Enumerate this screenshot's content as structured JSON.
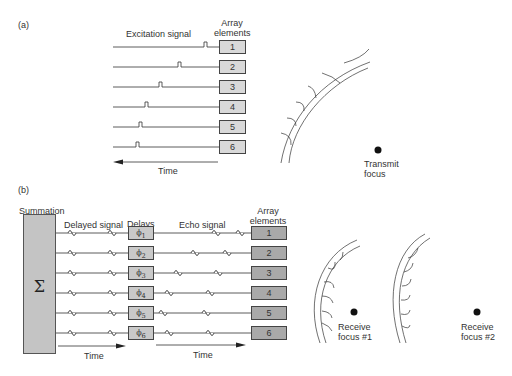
{
  "panel_a": {
    "label": "(a)",
    "excitation_label": "Excitation signal",
    "array_label_line1": "Array",
    "array_label_line2": "elements",
    "elements": [
      "1",
      "2",
      "3",
      "4",
      "5",
      "6"
    ],
    "time_label": "Time",
    "focus_label_line1": "Transmit",
    "focus_label_line2": "focus"
  },
  "panel_b": {
    "label": "(b)",
    "summation_label": "Summation",
    "sigma": "Σ",
    "delayed_signal_label": "Delayed signal",
    "delays_label": "Delays",
    "echo_signal_label": "Echo signal",
    "array_label_line1": "Array",
    "array_label_line2": "elements",
    "delays": [
      {
        "symbol": "ϕ",
        "sub": "1"
      },
      {
        "symbol": "ϕ",
        "sub": "2"
      },
      {
        "symbol": "ϕ",
        "sub": "3"
      },
      {
        "symbol": "ϕ",
        "sub": "4"
      },
      {
        "symbol": "ϕ",
        "sub": "5"
      },
      {
        "symbol": "ϕ",
        "sub": "6"
      }
    ],
    "elements": [
      "1",
      "2",
      "3",
      "4",
      "5",
      "6"
    ],
    "time_label_left": "Time",
    "time_label_right": "Time",
    "focus1_line1": "Receive",
    "focus1_line2": "focus #1",
    "focus2_line1": "Receive",
    "focus2_line2": "focus #2"
  }
}
